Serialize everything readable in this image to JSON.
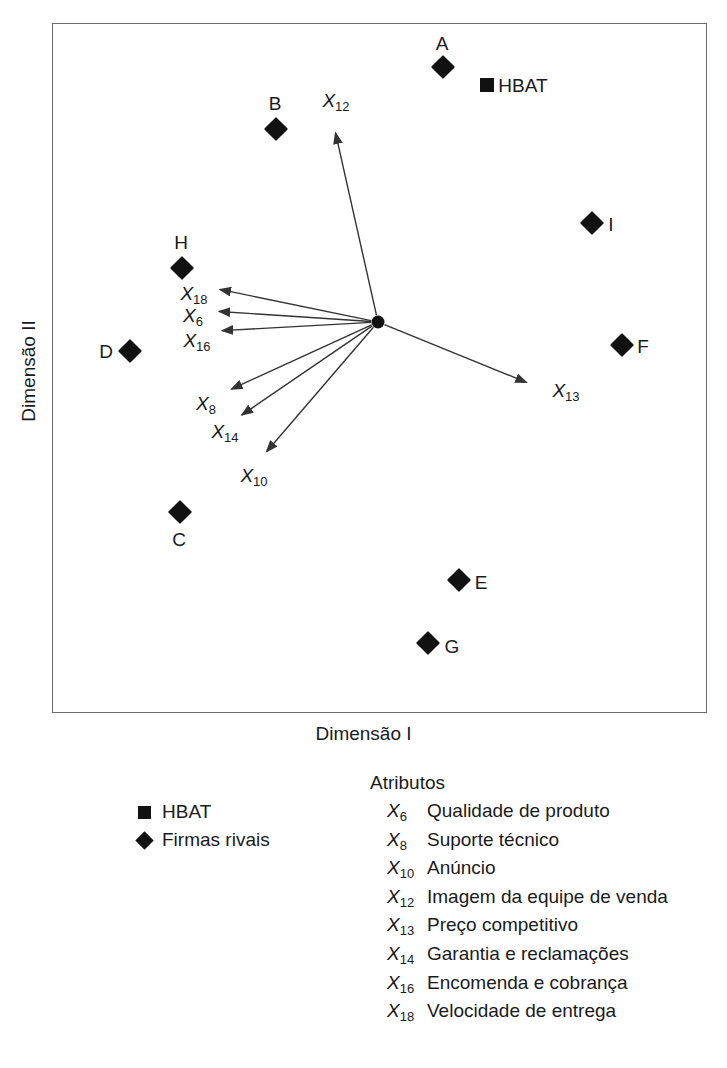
{
  "axes": {
    "x_title": "Dimensão I",
    "y_title": "Dimensão II"
  },
  "legend_symbols": {
    "items": [
      {
        "marker": "square",
        "label": "HBAT"
      },
      {
        "marker": "diamond",
        "label": "Firmas rivais"
      }
    ]
  },
  "legend_attributes": {
    "heading": "Atributos",
    "items": [
      {
        "code": "X",
        "sub": "6",
        "desc": "Qualidade de produto"
      },
      {
        "code": "X",
        "sub": "8",
        "desc": "Suporte técnico"
      },
      {
        "code": "X",
        "sub": "10",
        "desc": "Anúncio"
      },
      {
        "code": "X",
        "sub": "12",
        "desc": "Imagem da equipe de venda"
      },
      {
        "code": "X",
        "sub": "13",
        "desc": "Preço competitivo"
      },
      {
        "code": "X",
        "sub": "14",
        "desc": "Garantia e reclamações"
      },
      {
        "code": "X",
        "sub": "16",
        "desc": "Encomenda e cobrança"
      },
      {
        "code": "X",
        "sub": "18",
        "desc": "Velocidade de entrega"
      }
    ]
  },
  "plot_labels": {
    "hbat_inline": "HBAT"
  },
  "colors": {
    "marker": "#111111",
    "frame": "#6d6d6d",
    "text": "#1a1a1a",
    "vector": "#333333",
    "background": "#ffffff"
  },
  "chart_data": {
    "type": "scatter",
    "title": "",
    "subtitle": "",
    "xlabel": "Dimensão I",
    "ylabel": "Dimensão II",
    "grid": false,
    "axis_ticks": false,
    "legend_position": "below-plot",
    "xlim": [
      0,
      655
    ],
    "ylim": [
      0,
      690
    ],
    "note": "Mapa perceptual (MDS) com vetores de atributos irradiando do ponto central; coordenadas em pixels dentro da moldura do gráfico.",
    "origin": {
      "x": 378,
      "y": 322,
      "label": ""
    },
    "firms": [
      {
        "name": "A",
        "marker": "diamond",
        "x": 443,
        "y": 67,
        "label_x": 442,
        "label_y": 43,
        "label_pos": "above"
      },
      {
        "name": "HBAT",
        "marker": "square",
        "x": 487,
        "y": 85,
        "label_x": 523,
        "label_y": 85,
        "label_pos": "right"
      },
      {
        "name": "B",
        "marker": "diamond",
        "x": 276,
        "y": 129,
        "label_x": 275,
        "label_y": 103,
        "label_pos": "above"
      },
      {
        "name": "I",
        "marker": "diamond",
        "x": 592,
        "y": 223,
        "label_x": 611,
        "label_y": 224,
        "label_pos": "right"
      },
      {
        "name": "H",
        "marker": "diamond",
        "x": 182,
        "y": 268,
        "label_x": 181,
        "label_y": 242,
        "label_pos": "above"
      },
      {
        "name": "F",
        "marker": "diamond",
        "x": 622,
        "y": 345,
        "label_x": 643,
        "label_y": 346,
        "label_pos": "right"
      },
      {
        "name": "D",
        "marker": "diamond",
        "x": 130,
        "y": 351,
        "label_x": 106,
        "label_y": 351,
        "label_pos": "left"
      },
      {
        "name": "C",
        "marker": "diamond",
        "x": 180,
        "y": 512,
        "label_x": 179,
        "label_y": 539,
        "label_pos": "below"
      },
      {
        "name": "E",
        "marker": "diamond",
        "x": 459,
        "y": 580,
        "label_x": 481,
        "label_y": 582,
        "label_pos": "right"
      },
      {
        "name": "G",
        "marker": "diamond",
        "x": 428,
        "y": 643,
        "label_x": 452,
        "label_y": 646,
        "label_pos": "right"
      }
    ],
    "vectors": [
      {
        "code": "X",
        "sub": "12",
        "tip_x": 334,
        "tip_y": 126,
        "label_x": 336,
        "label_y": 100
      },
      {
        "code": "X",
        "sub": "18",
        "tip_x": 213,
        "tip_y": 288,
        "label_x": 194,
        "label_y": 293
      },
      {
        "code": "X",
        "sub": "6",
        "tip_x": 212,
        "tip_y": 311,
        "label_x": 193,
        "label_y": 315
      },
      {
        "code": "X",
        "sub": "16",
        "tip_x": 215,
        "tip_y": 331,
        "label_x": 197,
        "label_y": 340
      },
      {
        "code": "X",
        "sub": "13",
        "tip_x": 533,
        "tip_y": 385,
        "label_x": 566,
        "label_y": 390
      },
      {
        "code": "X",
        "sub": "8",
        "tip_x": 225,
        "tip_y": 392,
        "label_x": 206,
        "label_y": 403
      },
      {
        "code": "X",
        "sub": "14",
        "tip_x": 236,
        "tip_y": 419,
        "label_x": 225,
        "label_y": 431
      },
      {
        "code": "X",
        "sub": "10",
        "tip_x": 262,
        "tip_y": 457,
        "label_x": 254,
        "label_y": 475
      }
    ]
  }
}
